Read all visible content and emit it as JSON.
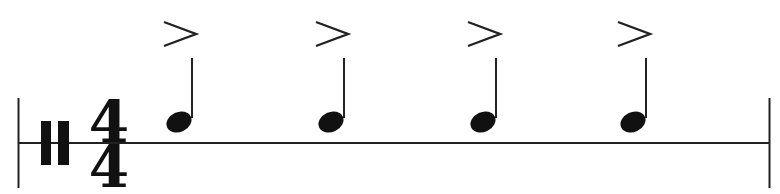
{
  "notation": {
    "type": "single-line percussion staff",
    "clef": "percussion-clef",
    "time_signature": {
      "numerator": "4",
      "denominator": "4"
    },
    "notes": [
      {
        "duration": "quarter",
        "articulation": "accent",
        "accent_symbol": ">",
        "x": 178
      },
      {
        "duration": "quarter",
        "articulation": "accent",
        "accent_symbol": ">",
        "x": 330
      },
      {
        "duration": "quarter",
        "articulation": "accent",
        "accent_symbol": ">",
        "x": 483
      },
      {
        "duration": "quarter",
        "articulation": "accent",
        "accent_symbol": ">",
        "x": 632
      }
    ],
    "barlines": [
      "start",
      "end"
    ],
    "colors": {
      "ink": "#111111",
      "background": "#ffffff"
    }
  }
}
